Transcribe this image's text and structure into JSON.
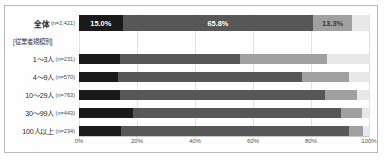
{
  "chart_data": {
    "type": "bar",
    "orientation": "horizontal",
    "stacked": true,
    "normalized_percent": true,
    "title": "",
    "xlabel": "",
    "ylabel": "",
    "xlim": [
      0,
      100
    ],
    "grid": true,
    "legend": "none",
    "tick_labels": [
      "0%",
      "20%",
      "40%",
      "60%",
      "80%",
      "100%"
    ],
    "tick_values": [
      0,
      20,
      40,
      60,
      80,
      100
    ],
    "group_header": "[従業者規模別]",
    "series": [
      {
        "name": "s1",
        "color": "#1a1a1a"
      },
      {
        "name": "s2",
        "color": "#575757"
      },
      {
        "name": "s3",
        "color": "#a0a0a0"
      },
      {
        "name": "s4",
        "color": "#e8e8e8"
      }
    ],
    "rows": [
      {
        "id": "total",
        "label": "全体",
        "n": "(n=2,421)",
        "is_total": true,
        "values": [
          15.0,
          65.8,
          13.3,
          5.9
        ],
        "labels": [
          "15.0%",
          "65.8%",
          "13.3%",
          ""
        ]
      },
      {
        "id": "size-1-3",
        "label": "1～3人",
        "n": "(n=231)",
        "is_total": false,
        "values": [
          14.0,
          41.5,
          30.0,
          14.5
        ],
        "labels": [
          "",
          "",
          "",
          ""
        ]
      },
      {
        "id": "size-4-9",
        "label": "4～9人",
        "n": "(n=570)",
        "is_total": false,
        "values": [
          13.5,
          63.5,
          16.0,
          7.0
        ],
        "labels": [
          "",
          "",
          "",
          ""
        ]
      },
      {
        "id": "size-10-29",
        "label": "10～29人",
        "n": "(n=763)",
        "is_total": false,
        "values": [
          14.0,
          71.0,
          11.0,
          4.0
        ],
        "labels": [
          "",
          "",
          "",
          ""
        ]
      },
      {
        "id": "size-30-99",
        "label": "30～99人",
        "n": "(n=443)",
        "is_total": false,
        "values": [
          18.5,
          72.0,
          7.0,
          2.5
        ],
        "labels": [
          "",
          "",
          "",
          ""
        ]
      },
      {
        "id": "size-100-plus",
        "label": "100人以上",
        "n": "(n=234)",
        "is_total": false,
        "values": [
          14.5,
          78.5,
          5.0,
          2.0
        ],
        "labels": [
          "",
          "",
          "",
          ""
        ]
      }
    ]
  }
}
